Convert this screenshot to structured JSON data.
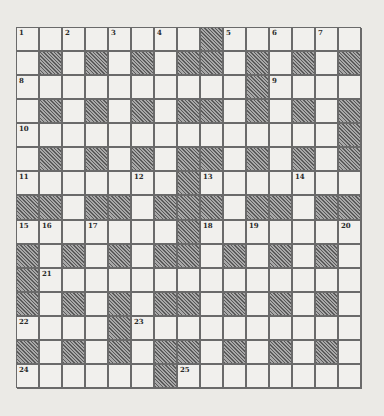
{
  "puzzle": {
    "rows": 15,
    "cols": 15,
    "colors": {
      "background": "#ebeae6",
      "cell": "#f1f0ed",
      "border": "#6a6a6a",
      "block_hatch_dark": "#5a5a5a",
      "block_hatch_light": "#a8a8a8",
      "number": "#2a2a2a"
    },
    "layout": [
      "........#......",
      ".#.#.#.##.#.#.#",
      "..........#....",
      ".#.#.#.##.#.#.#",
      "..............#",
      ".#.#.#.##.#.#.#",
      ".......#.......",
      "##.##.###.##.##",
      ".......#.......",
      "#.#.#.##.#.#.#.",
      "#..............",
      "#.#.#.##.#.#.#.",
      "....#..........",
      "#.#.#.##.#.#.#.",
      "......#........"
    ],
    "numbers": [
      {
        "n": "1",
        "row": 0,
        "col": 0
      },
      {
        "n": "2",
        "row": 0,
        "col": 2
      },
      {
        "n": "3",
        "row": 0,
        "col": 4
      },
      {
        "n": "4",
        "row": 0,
        "col": 6
      },
      {
        "n": "5",
        "row": 0,
        "col": 9
      },
      {
        "n": "6",
        "row": 0,
        "col": 11
      },
      {
        "n": "7",
        "row": 0,
        "col": 13
      },
      {
        "n": "8",
        "row": 2,
        "col": 0
      },
      {
        "n": "9",
        "row": 2,
        "col": 11
      },
      {
        "n": "10",
        "row": 4,
        "col": 0
      },
      {
        "n": "11",
        "row": 6,
        "col": 0
      },
      {
        "n": "12",
        "row": 6,
        "col": 5
      },
      {
        "n": "13",
        "row": 6,
        "col": 8
      },
      {
        "n": "14",
        "row": 6,
        "col": 12
      },
      {
        "n": "15",
        "row": 8,
        "col": 0
      },
      {
        "n": "16",
        "row": 8,
        "col": 1
      },
      {
        "n": "17",
        "row": 8,
        "col": 3
      },
      {
        "n": "18",
        "row": 8,
        "col": 8
      },
      {
        "n": "19",
        "row": 8,
        "col": 10
      },
      {
        "n": "20",
        "row": 8,
        "col": 14
      },
      {
        "n": "21",
        "row": 10,
        "col": 1
      },
      {
        "n": "22",
        "row": 12,
        "col": 0
      },
      {
        "n": "23",
        "row": 12,
        "col": 5
      },
      {
        "n": "24",
        "row": 14,
        "col": 0
      },
      {
        "n": "25",
        "row": 14,
        "col": 7
      }
    ]
  }
}
